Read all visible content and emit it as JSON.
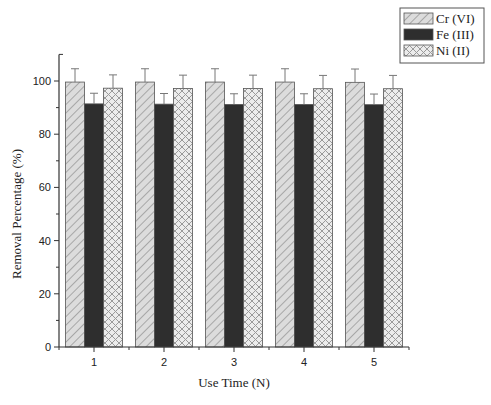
{
  "chart_data": {
    "type": "bar",
    "title": "",
    "xlabel": "Use Time (N)",
    "ylabel": "Removal Percentage (%)",
    "categories": [
      "1",
      "2",
      "3",
      "4",
      "5"
    ],
    "ylim": [
      0,
      110
    ],
    "yticks": [
      0,
      20,
      40,
      60,
      80,
      100
    ],
    "grid": false,
    "legend_position": "top-right",
    "series": [
      {
        "name": "Cr (VI)",
        "pattern": "diagonal-hatch",
        "color": "#d9d9d9",
        "values": [
          99.6,
          99.6,
          99.6,
          99.6,
          99.5
        ],
        "errors": [
          5,
          5,
          5,
          5,
          5
        ]
      },
      {
        "name": "Fe (III)",
        "pattern": "solid",
        "color": "#2e2e2e",
        "values": [
          91.4,
          91.3,
          91.2,
          91.2,
          91.1
        ],
        "errors": [
          4,
          4,
          4,
          4,
          4
        ]
      },
      {
        "name": "Ni (II)",
        "pattern": "crosshatch",
        "color": "#e6e6e6",
        "values": [
          97.3,
          97.2,
          97.2,
          97.1,
          97.1
        ],
        "errors": [
          5,
          5,
          5,
          5,
          5
        ]
      }
    ]
  }
}
